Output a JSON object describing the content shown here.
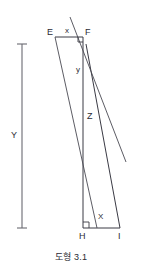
{
  "figure": {
    "caption": "도형 3.1",
    "colors": {
      "stroke": "#3a3a44",
      "measure_stroke": "#6a6a72",
      "label": "#2b2b33",
      "background": "#ffffff"
    },
    "vertices": [
      {
        "id": "E",
        "label": "E",
        "x": 55,
        "y": 37
      },
      {
        "id": "F",
        "label": "F",
        "x": 83,
        "y": 37
      },
      {
        "id": "Z",
        "label": "Z",
        "x": 84,
        "y": 116
      },
      {
        "id": "H",
        "label": "H",
        "x": 83,
        "y": 228
      },
      {
        "id": "I",
        "label": "I",
        "x": 120,
        "y": 228
      }
    ],
    "segment_labels": [
      {
        "id": "top-x",
        "label": "x",
        "x": 67,
        "y": 31
      },
      {
        "id": "upper-y",
        "label": "y",
        "x": 79,
        "y": 70
      },
      {
        "id": "bottom-X",
        "label": "X",
        "x": 100,
        "y": 216
      }
    ],
    "measure": {
      "label": "Y",
      "label_x": 12,
      "label_y": 131,
      "bar_x": 22,
      "top_y": 44,
      "bottom_y": 228,
      "cap_half_width": 5
    },
    "right_angles": [
      {
        "id": "angle-at-F",
        "x": 83,
        "y": 37,
        "size": 5
      },
      {
        "id": "angle-at-H",
        "x": 83,
        "y": 228,
        "size": 6
      }
    ]
  }
}
